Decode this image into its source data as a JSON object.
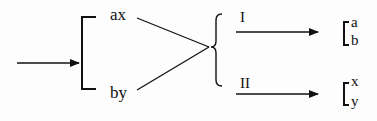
{
  "diagram": {
    "type": "flow-split",
    "colors": {
      "stroke": "#111111",
      "background": "#fdfdfd"
    },
    "input_arrow": {
      "label": ""
    },
    "left_group": {
      "items": [
        {
          "label": "ax"
        },
        {
          "label": "by"
        }
      ]
    },
    "branches": [
      {
        "label": "I",
        "output": [
          "a",
          "b"
        ]
      },
      {
        "label": "II",
        "output": [
          "x",
          "y"
        ]
      }
    ]
  }
}
